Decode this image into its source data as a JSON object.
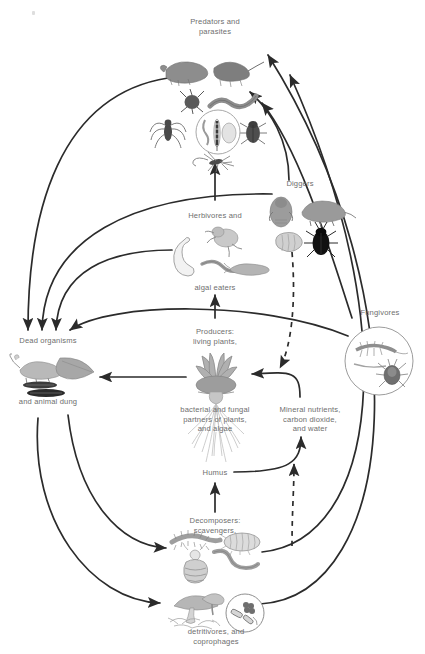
{
  "figure": {
    "type": "soil-food-web-cycle-diagram",
    "background_color": "#ffffff",
    "text_color": "#6e6e6e",
    "line_color": "#2b2b2b"
  },
  "nodes": [
    {
      "id": "predators",
      "label": "Predators and\nparasites",
      "x": 215,
      "y": 28,
      "label_align": "center",
      "organisms": [
        "shrew",
        "mole",
        "mite",
        "nematode",
        "spider",
        "beetle",
        "magnified-nematode-and-larva",
        "mosquito"
      ]
    },
    {
      "id": "diggers",
      "label": "Diggers",
      "x": 300,
      "y": 184,
      "label_align": "center",
      "organisms": [
        "mole",
        "vole",
        "grub",
        "beetle"
      ]
    },
    {
      "id": "herbivores",
      "label": "Herbivores and",
      "x": 215,
      "y": 216,
      "label_align": "center",
      "organisms": [
        "cicada-nymph",
        "grub",
        "worm",
        "slug"
      ]
    },
    {
      "id": "algal_eaters",
      "label": "algal eaters",
      "x": 215,
      "y": 287,
      "label_align": "center",
      "organisms": []
    },
    {
      "id": "fungivores",
      "label": "Fungivores",
      "x": 379,
      "y": 313,
      "label_align": "center",
      "organisms": [
        "springtail",
        "mite"
      ]
    },
    {
      "id": "dead_organisms",
      "label": "Dead organisms",
      "x": 47,
      "y": 341,
      "label_align": "center",
      "organisms": [
        "dead-mouse",
        "leaf",
        "dung-pellets"
      ]
    },
    {
      "id": "animal_dung",
      "label": "and animal dung",
      "x": 47,
      "y": 401,
      "label_align": "center",
      "organisms": []
    },
    {
      "id": "producers",
      "label": "Producers:\nliving plants,",
      "x": 215,
      "y": 332,
      "label_align": "center",
      "organisms": [
        "grass-tuft",
        "roots"
      ]
    },
    {
      "id": "partners",
      "label": "bacterial and fungal\npartners of plants,\nand algae",
      "x": 215,
      "y": 409,
      "label_align": "center",
      "organisms": []
    },
    {
      "id": "humus",
      "label": "Humus",
      "x": 215,
      "y": 472,
      "label_align": "center",
      "organisms": []
    },
    {
      "id": "minerals",
      "label": "Mineral nutrients,\ncarbon dioxide,\nand water",
      "x": 310,
      "y": 409,
      "label_align": "center",
      "organisms": []
    },
    {
      "id": "decomposers",
      "label": "Decomposers:\nscavengers,",
      "x": 215,
      "y": 521,
      "label_align": "center",
      "organisms": [
        "millipede",
        "woodlouse",
        "maggot",
        "worm"
      ]
    },
    {
      "id": "detritivores",
      "label": "detritivores, and\ncoprophages",
      "x": 215,
      "y": 631,
      "label_align": "center",
      "organisms": [
        "mushrooms",
        "magnified-bacteria"
      ]
    }
  ],
  "edges": [
    {
      "from": "herbivores",
      "to": "predators",
      "style": "solid",
      "direction": "up"
    },
    {
      "from": "diggers",
      "to": "predators",
      "style": "solid",
      "direction": "left-curve"
    },
    {
      "from": "fungivores",
      "to": "predators",
      "style": "solid",
      "direction": "left-curve"
    },
    {
      "from": "detritivores",
      "to": "predators",
      "style": "solid",
      "direction": "left-curve"
    },
    {
      "from": "decomposers",
      "to": "predators",
      "style": "solid",
      "direction": "left-curve"
    },
    {
      "from": "predators",
      "to": "dead_organisms",
      "style": "solid",
      "direction": "down-left-curve"
    },
    {
      "from": "diggers",
      "to": "dead_organisms",
      "style": "solid",
      "direction": "down-left-curve"
    },
    {
      "from": "herbivores",
      "to": "dead_organisms",
      "style": "solid",
      "direction": "down-left-curve"
    },
    {
      "from": "fungivores",
      "to": "dead_organisms",
      "style": "solid",
      "direction": "down-left-curve"
    },
    {
      "from": "producers",
      "to": "dead_organisms",
      "style": "solid",
      "direction": "left"
    },
    {
      "from": "producers",
      "to": "herbivores",
      "style": "solid",
      "direction": "up"
    },
    {
      "from": "minerals",
      "to": "producers",
      "style": "solid",
      "direction": "curve-left"
    },
    {
      "from": "humus",
      "to": "minerals",
      "style": "solid",
      "direction": "curve-right-up"
    },
    {
      "from": "decomposers",
      "to": "humus",
      "style": "solid",
      "direction": "up"
    },
    {
      "from": "decomposers",
      "to": "minerals",
      "style": "dashed",
      "direction": "up"
    },
    {
      "from": "diggers",
      "to": "producers",
      "style": "dashed",
      "direction": "down"
    },
    {
      "from": "dead_organisms",
      "to": "decomposers",
      "style": "solid",
      "direction": "down-right-curve"
    },
    {
      "from": "dead_organisms",
      "to": "detritivores",
      "style": "solid",
      "direction": "down-right-curve"
    }
  ]
}
